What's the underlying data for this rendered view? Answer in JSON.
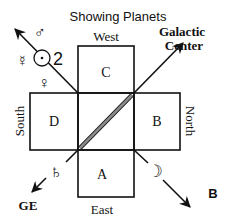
{
  "title": "Showing Planets",
  "panel_label": "B",
  "boxes": {
    "top": "C",
    "left": "D",
    "right": "B",
    "bottom": "A"
  },
  "directions": {
    "top": "West",
    "left": "South",
    "right": "North",
    "bottom": "East"
  },
  "galactic_center": {
    "line1": "Galactic",
    "line2": "Center"
  },
  "ge_label": "GE",
  "planets": {
    "mars": "♂",
    "jupiter": "♃",
    "jupiter_text": "2",
    "sun": "⊙",
    "mercury": "☿",
    "venus": "♀",
    "saturn": "♄",
    "moon": "☽"
  },
  "colors": {
    "line": "#111111",
    "diagonal": "#888888"
  }
}
